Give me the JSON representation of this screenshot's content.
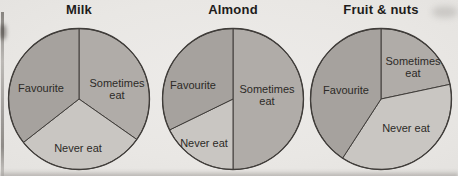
{
  "chart_data": {
    "type": "pie",
    "chart_count": 3,
    "categories": [
      "Favourite",
      "Sometimes eat",
      "Never eat"
    ],
    "angle_note": "start_deg/end_deg measured clockwise from 12 o'clock; no numeric values printed on the figure, percents estimated from slice angles",
    "colors": {
      "favourite": "#a6a29e",
      "sometimes_eat": "#b0aca8",
      "never_eat": "#c9c6c2",
      "outline": "#403d3a",
      "label_text": "#2c2a27",
      "title_text": "#1e1c1a",
      "background": "#e9e7e4"
    },
    "charts": [
      {
        "title": "Milk",
        "slices": [
          {
            "label": "Sometimes eat",
            "lines": [
              "Sometimes",
              "eat"
            ],
            "start_deg": 0,
            "end_deg": 125,
            "span_deg": 125,
            "approx_percent": 35,
            "color_key": "sometimes_eat",
            "label_offset": [
              38,
              -10
            ]
          },
          {
            "label": "Never eat",
            "lines": [
              "Never eat"
            ],
            "start_deg": 125,
            "end_deg": 232,
            "span_deg": 107,
            "approx_percent": 30,
            "color_key": "never_eat",
            "label_offset": [
              -1,
              49
            ]
          },
          {
            "label": "Favourite",
            "lines": [
              "Favourite"
            ],
            "start_deg": 232,
            "end_deg": 360,
            "span_deg": 128,
            "approx_percent": 35,
            "color_key": "favourite",
            "label_offset": [
              -38,
              -11
            ]
          }
        ]
      },
      {
        "title": "Almond",
        "slices": [
          {
            "label": "Sometimes eat",
            "lines": [
              "Sometimes",
              "eat"
            ],
            "start_deg": 0,
            "end_deg": 180,
            "span_deg": 180,
            "approx_percent": 50,
            "color_key": "sometimes_eat",
            "label_offset": [
              34,
              -4
            ]
          },
          {
            "label": "Never eat",
            "lines": [
              "Never eat"
            ],
            "start_deg": 180,
            "end_deg": 244,
            "span_deg": 64,
            "approx_percent": 18,
            "color_key": "never_eat",
            "label_offset": [
              -29,
              44
            ]
          },
          {
            "label": "Favourite",
            "lines": [
              "Favourite"
            ],
            "start_deg": 244,
            "end_deg": 360,
            "span_deg": 116,
            "approx_percent": 32,
            "color_key": "favourite",
            "label_offset": [
              -40,
              -14
            ]
          }
        ]
      },
      {
        "title": "Fruit & nuts",
        "slices": [
          {
            "label": "Sometimes eat",
            "lines": [
              "Sometimes",
              "eat"
            ],
            "start_deg": 0,
            "end_deg": 78,
            "span_deg": 78,
            "approx_percent": 22,
            "color_key": "sometimes_eat",
            "label_offset": [
              32,
              -32
            ]
          },
          {
            "label": "Never eat",
            "lines": [
              "Never eat"
            ],
            "start_deg": 78,
            "end_deg": 213,
            "span_deg": 135,
            "approx_percent": 37,
            "color_key": "never_eat",
            "label_offset": [
              25,
              29
            ]
          },
          {
            "label": "Favourite",
            "lines": [
              "Favourite"
            ],
            "start_deg": 213,
            "end_deg": 360,
            "span_deg": 147,
            "approx_percent": 41,
            "color_key": "favourite",
            "label_offset": [
              -35,
              -9
            ]
          }
        ]
      }
    ],
    "layout": {
      "pie_centers_x": [
        79,
        233,
        381
      ],
      "pie_center_y": 99,
      "pie_radius": 70.5
    }
  }
}
